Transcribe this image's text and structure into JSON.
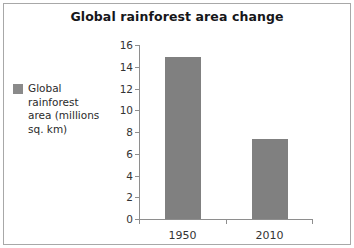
{
  "chart_data": {
    "type": "bar",
    "title": "Global rainforest area change",
    "categories": [
      "1950",
      "2010"
    ],
    "values": [
      14.9,
      7.4
    ],
    "series": [
      {
        "name": "Global rainforest area (millions sq. km)",
        "values": [
          14.9,
          7.4
        ]
      }
    ],
    "xlabel": "",
    "ylabel": "",
    "ylim": [
      0,
      16
    ],
    "yticks": [
      0,
      2,
      4,
      6,
      8,
      10,
      12,
      14,
      16
    ],
    "ytick_labels": [
      "0",
      "2",
      "4",
      "6",
      "8",
      "10",
      "12",
      "14",
      "16"
    ],
    "grid": false,
    "legend_position": "left",
    "bar_color": "#808080",
    "axis_color": "#8e8e8e",
    "text_color": "#333333",
    "title_color": "#16161a"
  },
  "legend": {
    "swatch_color": "#8a8a8a",
    "label": "Global\nrainforest\narea (millions\nsq. km)"
  }
}
